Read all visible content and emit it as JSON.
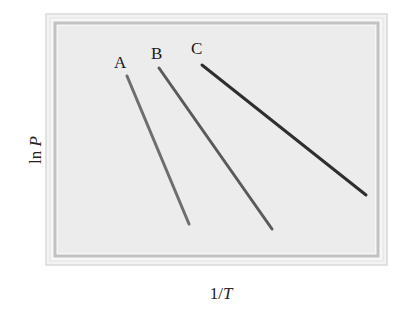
{
  "chart_data": {
    "type": "line",
    "title": "",
    "xlabel": "1/T",
    "ylabel": "ln P",
    "xlabel_parts": {
      "prefix": "1/",
      "var": "T"
    },
    "ylabel_parts": {
      "prefix": "ln ",
      "var": "P"
    },
    "grid": false,
    "ticks": "none",
    "legend": "inline labels at top end of each line",
    "units": "qualitative (no numeric axis scale shown); coordinates are relative 0-1 fractions of the plot area",
    "series": [
      {
        "name": "A",
        "color": "#6e6e6e",
        "points": [
          {
            "x": 0.22,
            "y": 0.79
          },
          {
            "x": 0.41,
            "y": 0.13
          }
        ],
        "px": [
          [
            127,
            76
          ],
          [
            189,
            224
          ]
        ]
      },
      {
        "name": "B",
        "color": "#5a5a5a",
        "points": [
          {
            "x": 0.32,
            "y": 0.82
          },
          {
            "x": 0.67,
            "y": 0.11
          }
        ],
        "px": [
          [
            159,
            68
          ],
          [
            272,
            229
          ]
        ]
      },
      {
        "name": "C",
        "color": "#2e2e2e",
        "points": [
          {
            "x": 0.45,
            "y": 0.84
          },
          {
            "x": 0.97,
            "y": 0.26
          }
        ],
        "px": [
          [
            202,
            65
          ],
          [
            366,
            195
          ]
        ]
      }
    ]
  },
  "frame": {
    "outer_bg": "#f1f1f1",
    "inner_rule": "#c4c4c4",
    "plot_bg": "#ececec"
  },
  "labels": {
    "A": "A",
    "B": "B",
    "C": "C"
  }
}
